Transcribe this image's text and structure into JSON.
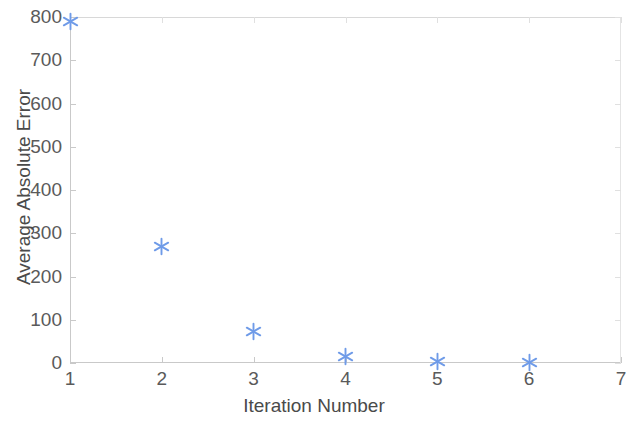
{
  "chart_data": {
    "type": "scatter",
    "title": "",
    "xlabel": "Iteration Number",
    "ylabel": "Average Absolute Error",
    "x": [
      1,
      2,
      3,
      4,
      5,
      6
    ],
    "values": [
      790,
      270,
      72,
      16,
      4,
      2
    ],
    "series": [
      {
        "name": "Average Absolute Error",
        "marker": "asterisk",
        "color": "#6f9be8",
        "points": [
          {
            "x": 1,
            "y": 790
          },
          {
            "x": 2,
            "y": 270
          },
          {
            "x": 3,
            "y": 72
          },
          {
            "x": 4,
            "y": 16
          },
          {
            "x": 5,
            "y": 4
          },
          {
            "x": 6,
            "y": 2
          }
        ]
      }
    ],
    "xlim": [
      1,
      7
    ],
    "ylim": [
      0,
      800
    ],
    "xticks": [
      1,
      2,
      3,
      4,
      5,
      6,
      7
    ],
    "yticks": [
      0,
      100,
      200,
      300,
      400,
      500,
      600,
      700,
      800
    ],
    "xtick_labels": [
      "1",
      "2",
      "3",
      "4",
      "5",
      "6",
      "7"
    ],
    "ytick_labels": [
      "0",
      "100",
      "200",
      "300",
      "400",
      "500",
      "600",
      "700",
      "800"
    ],
    "grid": false,
    "legend": null,
    "legend_position": "none",
    "background_color": "#ffffff",
    "axis_color": "#c9c9c9",
    "text_color": "#4a4a4a"
  }
}
